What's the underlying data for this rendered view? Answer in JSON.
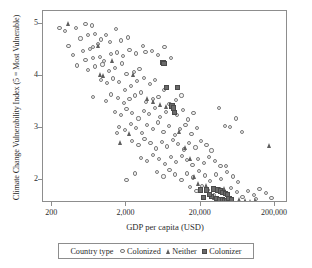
{
  "chart_data": {
    "type": "scatter",
    "title": "",
    "xlabel": "GDP per capita (USD)",
    "ylabel": "Climate Change Vulnerability Index (5 = Most Vulnerable)",
    "xscale": "log",
    "xlim": [
      150,
      300000
    ],
    "ylim": [
      1.55,
      5.25
    ],
    "xticks": [
      200,
      2000,
      20000,
      200000
    ],
    "xticklabels": [
      "200",
      "2,000",
      "20,000",
      "200,000"
    ],
    "yticks": [
      2,
      3,
      4,
      5
    ],
    "yticklabels": [
      "2",
      "3",
      "4",
      "5"
    ],
    "grid": false,
    "legend_position": "below-axes",
    "legend_title": "Country type",
    "series": [
      {
        "name": "Colonized",
        "marker": "circle",
        "color": "#7a7a7a",
        "points": [
          [
            250,
            4.93
          ],
          [
            300,
            4.86
          ],
          [
            420,
            4.93
          ],
          [
            560,
            5.0
          ],
          [
            690,
            4.97
          ],
          [
            330,
            4.58
          ],
          [
            480,
            4.72
          ],
          [
            610,
            4.78
          ],
          [
            760,
            4.8
          ],
          [
            900,
            4.7
          ],
          [
            380,
            4.4
          ],
          [
            520,
            4.48
          ],
          [
            640,
            4.52
          ],
          [
            700,
            4.55
          ],
          [
            820,
            4.62
          ],
          [
            1050,
            4.78
          ],
          [
            1200,
            4.65
          ],
          [
            1450,
            4.9
          ],
          [
            1700,
            4.68
          ],
          [
            2100,
            4.74
          ],
          [
            560,
            4.3
          ],
          [
            700,
            4.34
          ],
          [
            880,
            4.36
          ],
          [
            1000,
            4.28
          ],
          [
            1250,
            4.42
          ],
          [
            1500,
            4.45
          ],
          [
            1800,
            4.38
          ],
          [
            2200,
            4.5
          ],
          [
            2700,
            4.43
          ],
          [
            3300,
            4.58
          ],
          [
            430,
            4.2
          ],
          [
            600,
            4.12
          ],
          [
            750,
            4.18
          ],
          [
            950,
            4.22
          ],
          [
            1150,
            4.1
          ],
          [
            1400,
            4.15
          ],
          [
            1750,
            4.24
          ],
          [
            2000,
            4.04
          ],
          [
            2500,
            4.08
          ],
          [
            3000,
            4.13
          ],
          [
            3600,
            4.46
          ],
          [
            4400,
            4.48
          ],
          [
            5300,
            4.4
          ],
          [
            6500,
            4.55
          ],
          [
            8000,
            4.35
          ],
          [
            900,
            3.92
          ],
          [
            1100,
            3.86
          ],
          [
            1300,
            3.95
          ],
          [
            1600,
            3.88
          ],
          [
            1900,
            3.72
          ],
          [
            2300,
            3.8
          ],
          [
            2800,
            3.9
          ],
          [
            3400,
            3.96
          ],
          [
            4100,
            3.84
          ],
          [
            4900,
            3.92
          ],
          [
            700,
            3.6
          ],
          [
            1050,
            3.52
          ],
          [
            1250,
            3.64
          ],
          [
            1550,
            3.58
          ],
          [
            1850,
            3.48
          ],
          [
            2200,
            3.55
          ],
          [
            2600,
            3.62
          ],
          [
            3100,
            3.68
          ],
          [
            3700,
            3.5
          ],
          [
            4500,
            3.56
          ],
          [
            5400,
            3.6
          ],
          [
            6400,
            3.72
          ],
          [
            7600,
            3.46
          ],
          [
            9200,
            3.54
          ],
          [
            11000,
            3.62
          ],
          [
            1400,
            3.3
          ],
          [
            1700,
            3.24
          ],
          [
            2000,
            3.36
          ],
          [
            2400,
            3.28
          ],
          [
            2900,
            3.18
          ],
          [
            3400,
            3.33
          ],
          [
            4000,
            3.26
          ],
          [
            4800,
            3.38
          ],
          [
            5700,
            3.2
          ],
          [
            6800,
            3.3
          ],
          [
            8100,
            3.42
          ],
          [
            9700,
            3.25
          ],
          [
            11500,
            3.34
          ],
          [
            13500,
            3.16
          ],
          [
            16000,
            3.28
          ],
          [
            1600,
            3.02
          ],
          [
            1900,
            2.96
          ],
          [
            2300,
            3.08
          ],
          [
            2700,
            3.0
          ],
          [
            3200,
            2.9
          ],
          [
            3800,
            3.05
          ],
          [
            4500,
            2.98
          ],
          [
            5300,
            3.1
          ],
          [
            6300,
            2.92
          ],
          [
            7500,
            3.04
          ],
          [
            8900,
            2.86
          ],
          [
            10500,
            2.98
          ],
          [
            12500,
            3.06
          ],
          [
            15000,
            2.88
          ],
          [
            18000,
            3.0
          ],
          [
            2400,
            2.74
          ],
          [
            2900,
            2.66
          ],
          [
            3500,
            2.78
          ],
          [
            4200,
            2.7
          ],
          [
            5000,
            2.6
          ],
          [
            6000,
            2.72
          ],
          [
            7100,
            2.64
          ],
          [
            8400,
            2.76
          ],
          [
            10000,
            2.68
          ],
          [
            12000,
            2.58
          ],
          [
            14000,
            2.7
          ],
          [
            17000,
            2.62
          ],
          [
            20000,
            2.74
          ],
          [
            24000,
            2.66
          ],
          [
            28000,
            2.56
          ],
          [
            3100,
            2.42
          ],
          [
            3800,
            2.36
          ],
          [
            4600,
            2.48
          ],
          [
            5500,
            2.4
          ],
          [
            6600,
            2.3
          ],
          [
            7900,
            2.44
          ],
          [
            9400,
            2.34
          ],
          [
            11200,
            2.46
          ],
          [
            13000,
            2.38
          ],
          [
            15500,
            2.28
          ],
          [
            18500,
            2.4
          ],
          [
            22000,
            2.32
          ],
          [
            26000,
            2.44
          ],
          [
            31000,
            2.36
          ],
          [
            37000,
            2.26
          ],
          [
            5200,
            2.14
          ],
          [
            6300,
            2.06
          ],
          [
            7600,
            2.18
          ],
          [
            9100,
            2.1
          ],
          [
            11000,
            2.0
          ],
          [
            13200,
            2.12
          ],
          [
            15800,
            2.04
          ],
          [
            19000,
            2.16
          ],
          [
            23000,
            2.08
          ],
          [
            27000,
            1.98
          ],
          [
            32000,
            2.1
          ],
          [
            38000,
            2.02
          ],
          [
            45000,
            2.14
          ],
          [
            54000,
            2.06
          ],
          [
            64000,
            1.96
          ],
          [
            14500,
            1.86
          ],
          [
            17500,
            1.78
          ],
          [
            21000,
            1.88
          ],
          [
            25000,
            1.8
          ],
          [
            30000,
            1.7
          ],
          [
            36000,
            1.82
          ],
          [
            43000,
            1.74
          ],
          [
            51000,
            1.84
          ],
          [
            61000,
            1.76
          ],
          [
            73000,
            1.66
          ],
          [
            87000,
            1.78
          ],
          [
            104000,
            1.7
          ],
          [
            124000,
            1.82
          ],
          [
            150000,
            1.74
          ],
          [
            180000,
            1.64
          ],
          [
            35000,
            3.38
          ],
          [
            42000,
            3.04
          ],
          [
            50000,
            3.02
          ],
          [
            60000,
            3.18
          ],
          [
            72000,
            2.92
          ],
          [
            44000,
            2.26
          ],
          [
            110000,
            1.62
          ],
          [
            2000,
            2.0
          ],
          [
            1500,
            2.9
          ],
          [
            2600,
            2.12
          ]
        ]
      },
      {
        "name": "Neither",
        "marker": "triangle",
        "color": "#5e5e5e",
        "points": [
          [
            330,
            5.0
          ],
          [
            860,
            4.58
          ],
          [
            1300,
            4.3
          ],
          [
            900,
            4.02
          ],
          [
            1000,
            4.0
          ],
          [
            2500,
            4.02
          ],
          [
            3900,
            3.56
          ],
          [
            4700,
            3.5
          ],
          [
            7000,
            3.4
          ],
          [
            10500,
            2.92
          ],
          [
            12500,
            2.62
          ],
          [
            14500,
            2.4
          ],
          [
            16500,
            2.06
          ],
          [
            19000,
            1.92
          ],
          [
            21000,
            1.78
          ],
          [
            24000,
            1.88
          ],
          [
            27000,
            1.72
          ],
          [
            31000,
            1.66
          ],
          [
            36000,
            1.6
          ],
          [
            42000,
            1.82
          ],
          [
            48000,
            1.64
          ],
          [
            56000,
            1.58
          ],
          [
            68000,
            1.62
          ],
          [
            82000,
            1.6
          ],
          [
            96000,
            1.58
          ],
          [
            110000,
            1.6
          ],
          [
            25000,
            1.5
          ],
          [
            33000,
            1.52
          ],
          [
            170000,
            2.66
          ],
          [
            5800,
            3.44
          ],
          [
            1700,
            2.72
          ],
          [
            2200,
            2.88
          ]
        ]
      },
      {
        "name": "Colonizer",
        "marker": "square",
        "color": "#6a6a6a",
        "points": [
          [
            7000,
            3.78
          ],
          [
            9800,
            3.78
          ],
          [
            8200,
            3.42
          ],
          [
            8700,
            3.38
          ],
          [
            8900,
            3.3
          ],
          [
            6200,
            4.26
          ],
          [
            6400,
            4.24
          ],
          [
            20000,
            1.8
          ],
          [
            24000,
            1.8
          ],
          [
            30000,
            1.82
          ],
          [
            34000,
            1.8
          ],
          [
            37000,
            1.78
          ],
          [
            40000,
            1.76
          ],
          [
            43000,
            1.74
          ],
          [
            46000,
            1.72
          ],
          [
            33000,
            1.64
          ],
          [
            36000,
            1.62
          ],
          [
            39000,
            1.62
          ],
          [
            42000,
            1.6
          ],
          [
            45000,
            1.6
          ],
          [
            28000,
            1.68
          ],
          [
            48000,
            1.64
          ],
          [
            52000,
            1.62
          ],
          [
            26000,
            1.72
          ],
          [
            22000,
            1.66
          ]
        ]
      }
    ]
  },
  "axes": {
    "ytick_labels": [
      "5",
      "4",
      "3",
      "2"
    ],
    "xtick_labels": [
      "200",
      "2,000",
      "20,000",
      "200,000"
    ]
  },
  "legend": {
    "title": "Country type",
    "items": [
      {
        "label": "Colonized",
        "marker": "circle"
      },
      {
        "label": "Neither",
        "marker": "triangle"
      },
      {
        "label": "Colonizer",
        "marker": "square"
      }
    ]
  }
}
